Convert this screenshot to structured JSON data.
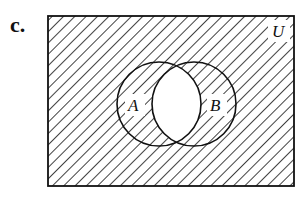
{
  "figure": {
    "part_label": "c.",
    "universe_label": "U",
    "set_a_label": "A",
    "set_b_label": "B",
    "shaded_region": "complement of A ∩ B",
    "colors": {
      "ink": "#111111",
      "background": "#ffffff"
    }
  }
}
